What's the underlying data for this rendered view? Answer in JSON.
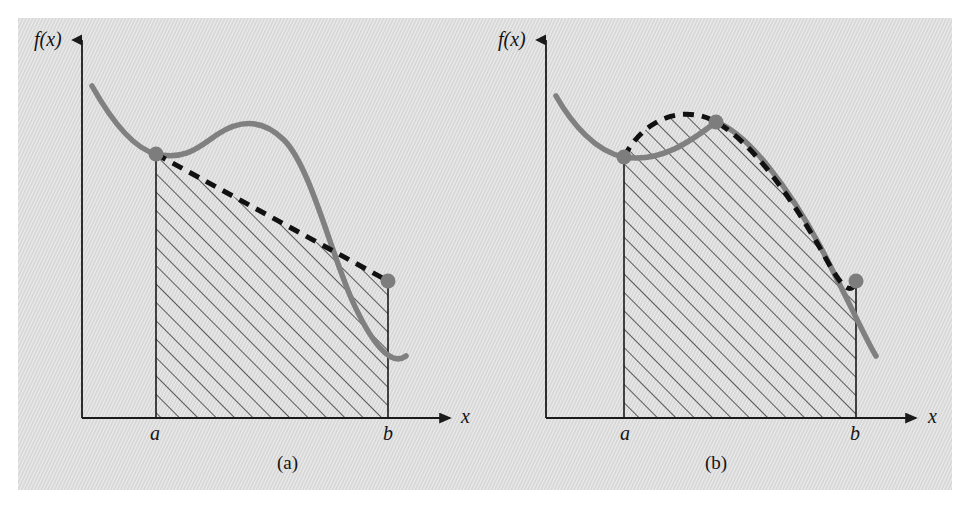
{
  "figure": {
    "background_color": "#d8d8d8",
    "page_color": "#ffffff",
    "curve_color": "#808080",
    "dash_color": "#111111",
    "axis_color": "#1a1a1a",
    "hatch_color": "#1f1f1f"
  },
  "panels": [
    {
      "id": "a",
      "caption": "(a)",
      "caption_pos": {
        "x": 290,
        "y": 455
      },
      "y_axis_label": "f(x)",
      "y_axis_label_pos": {
        "x": 34,
        "y": 28
      },
      "x_axis_label": "x",
      "x_axis_label_pos": {
        "x": 461,
        "y": 407
      },
      "tick_labels": [
        {
          "text": "a",
          "x": 150,
          "y": 424
        },
        {
          "text": "b",
          "x": 383,
          "y": 424
        }
      ],
      "axes": {
        "origin": {
          "x": 82,
          "y": 418
        },
        "y_axis_top": {
          "x": 82,
          "y": 36
        },
        "x_axis_right": {
          "x": 456,
          "y": 418
        }
      },
      "interval": {
        "a_x": 155,
        "b_x": 388
      },
      "curve_points": "M 92,86 C 110,118 132,148 156,154 C 186,161 200,146 218,134 C 244,117 266,122 284,140 C 310,166 330,250 352,300 C 370,340 390,368 406,356",
      "dashed_path": "M 156,154 L 388,281",
      "dots": [
        {
          "x": 156,
          "y": 154,
          "r": 7.5
        },
        {
          "x": 388,
          "y": 281,
          "r": 7.5
        }
      ],
      "shaded_region": "M 156,154 L 388,281 L 388,418 L 156,418 Z",
      "shading": "diagonal-hatch-45"
    },
    {
      "id": "b",
      "caption": "(b)",
      "caption_pos": {
        "x": 718,
        "y": 455
      },
      "y_axis_label": "f(x)",
      "y_axis_label_pos": {
        "x": 498,
        "y": 28
      },
      "x_axis_label": "x",
      "x_axis_label_pos": {
        "x": 928,
        "y": 407
      },
      "tick_labels": [
        {
          "text": "a",
          "x": 620,
          "y": 424
        },
        {
          "text": "b",
          "x": 850,
          "y": 424
        }
      ],
      "axes": {
        "origin": {
          "x": 546,
          "y": 418
        },
        "y_axis_top": {
          "x": 546,
          "y": 36
        },
        "x_axis_right": {
          "x": 922,
          "y": 418
        }
      },
      "interval": {
        "a_x": 625,
        "b_x": 855
      },
      "curve_points": "M 556,96 C 572,124 596,152 624,157 C 660,163 690,142 716,122 C 748,133 790,190 820,246 C 846,295 866,340 876,356",
      "dashed_path": "M 624,157 C 644,118 684,104 716,122 C 752,142 790,196 820,248 C 838,279 850,302 856,281",
      "dots": [
        {
          "x": 624,
          "y": 157,
          "r": 7.5
        },
        {
          "x": 716,
          "y": 122,
          "r": 7.5
        },
        {
          "x": 856,
          "y": 281,
          "r": 7.5
        }
      ],
      "shaded_region": "M 624,157 C 644,118 684,104 716,122 C 752,142 790,196 820,248 C 838,279 850,302 856,281 L 856,418 L 624,418 Z",
      "shading": "diagonal-hatch-45"
    }
  ]
}
